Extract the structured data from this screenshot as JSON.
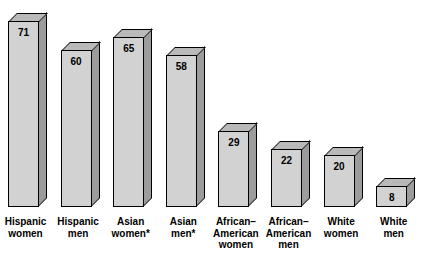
{
  "chart_data": {
    "type": "bar",
    "title": "",
    "subtitle": "",
    "xlabel": "",
    "ylabel": "",
    "grid": false,
    "legend": "none",
    "style": "3d-column",
    "ylim": [
      0,
      75
    ],
    "categories": [
      "Hispanic\nwomen",
      "Hispanic\nmen",
      "Asian\nwomen*",
      "Asian\nmen*",
      "African–\nAmerican\nwomen",
      "African–\nAmerican\nmen",
      "White\nwomen",
      "White\nmen"
    ],
    "values": [
      71,
      60,
      65,
      58,
      29,
      22,
      20,
      8
    ],
    "bars": [
      {
        "label": "Hispanic\nwomen",
        "value": 71,
        "value_text": "71"
      },
      {
        "label": "Hispanic\nmen",
        "value": 60,
        "value_text": "60"
      },
      {
        "label": "Asian\nwomen*",
        "value": 65,
        "value_text": "65"
      },
      {
        "label": "Asian\nmen*",
        "value": 58,
        "value_text": "58"
      },
      {
        "label": "African–\nAmerican\nwomen",
        "value": 29,
        "value_text": "29"
      },
      {
        "label": "African–\nAmerican\nmen",
        "value": 22,
        "value_text": "22"
      },
      {
        "label": "White\nwomen",
        "value": 20,
        "value_text": "20"
      },
      {
        "label": "White\nmen",
        "value": 8,
        "value_text": "8"
      }
    ],
    "colors": {
      "bar_front": "#d2d2d2",
      "bar_side": "#9c9c9c",
      "bar_top": "#b9b9b9",
      "outline": "#000000",
      "text": "#000000",
      "background": "#ffffff"
    }
  }
}
